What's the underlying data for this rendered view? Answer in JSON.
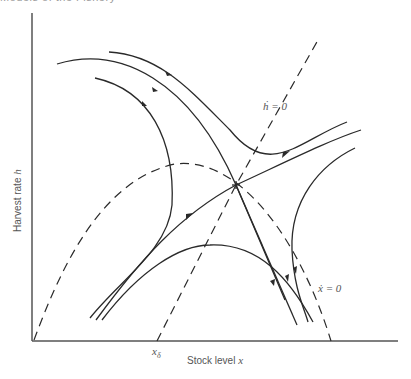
{
  "page": {
    "header_cutoff_text": "Models of the Fishery"
  },
  "figure": {
    "type": "phase_diagram",
    "y_axis_label": "Harvest rate h",
    "y_axis_label_text": "Harvest rate ",
    "y_axis_var": "h",
    "x_axis_label_text": "Stock level ",
    "x_axis_var": "x",
    "x_tick_label": "x",
    "x_tick_sub": "δ",
    "nullclines": [
      {
        "id": "h-dot-zero",
        "label": "ḣ = 0",
        "style": "dashed",
        "shape": "line"
      },
      {
        "id": "x-dot-zero",
        "label": "ẋ = 0",
        "style": "dashed",
        "shape": "parabola"
      },
      {
        "id": "left-bound",
        "label": "",
        "style": "dashed",
        "shape": "curve"
      }
    ],
    "equilibrium": {
      "type": "saddle point",
      "position": [
        236,
        185
      ]
    },
    "trajectories_count": 10
  }
}
